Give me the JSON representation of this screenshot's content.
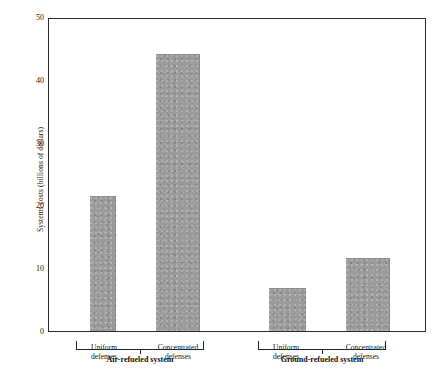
{
  "chart_data": {
    "type": "bar",
    "title": "",
    "xlabel": "",
    "ylabel": "Systems costs (billions of dollars)",
    "ylim": [
      0,
      50
    ],
    "yticks": [
      0,
      10,
      20,
      30,
      40,
      50
    ],
    "ytick_labels": [
      "0",
      "10",
      "20",
      "30",
      "40",
      "50"
    ],
    "grid": false,
    "legend": "none",
    "categories": [
      "Uniform defenses",
      "Concentrated defenses",
      "Uniform defenses",
      "Concentrated defenses"
    ],
    "values": [
      21.5,
      44.3,
      6.7,
      11.6
    ],
    "groups": [
      {
        "label": "Air-refueled system",
        "categories": [
          "Uniform defenses",
          "Concentrated defenses"
        ],
        "values": [
          21.5,
          44.3
        ]
      },
      {
        "label": "Ground-refueled system",
        "categories": [
          "Uniform defenses",
          "Concentrated defenses"
        ],
        "values": [
          6.7,
          11.6
        ]
      }
    ],
    "bar_color": "#9b9b9b",
    "axis_color": "#2b2b2b"
  },
  "axis": {
    "y_title": "Systems costs (billions of dollars)",
    "ticks": {
      "t50": "50",
      "t40": "40",
      "t30": "30",
      "t20": "20",
      "t10": "10",
      "t0": "0"
    }
  },
  "categories": {
    "g1b1_line1": "Uniform",
    "g1b1_line2": "defenses",
    "g1b2_line1": "Concentrated",
    "g1b2_line2": "defenses",
    "g2b1_line1": "Uniform",
    "g2b1_line2": "defenses",
    "g2b2_line1": "Concentrated",
    "g2b2_line2": "defenses"
  },
  "groups": {
    "left": "Air-refueled system",
    "right": "Ground-refueled system"
  }
}
